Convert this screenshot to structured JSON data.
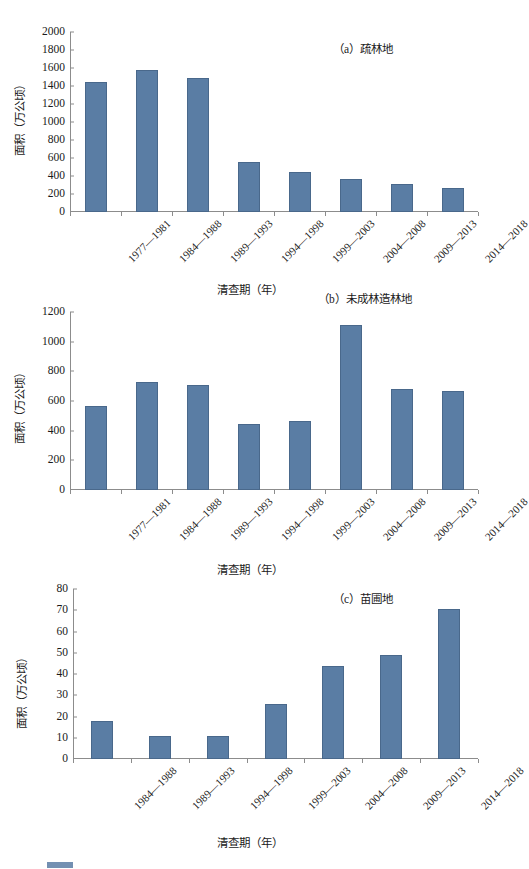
{
  "figure": {
    "axis_titles": {
      "y": "面积（万公顷）",
      "x": "清查期（年）"
    },
    "bar_color": "#5a7da4",
    "axis_color": "#8c8c8c"
  },
  "chart_data": [
    {
      "id": "a",
      "type": "bar",
      "title": "（a）疏林地",
      "xlabel": "清查期（年）",
      "ylabel": "面积（万公顷）",
      "ylim": [
        0,
        2000
      ],
      "yticks": [
        0,
        200,
        400,
        600,
        800,
        1000,
        1200,
        1400,
        1600,
        1800,
        2000
      ],
      "grid": false,
      "legend": "none",
      "categories": [
        "1977—1981",
        "1984—1988",
        "1989—1993",
        "1994—1998",
        "1999—2003",
        "2004—2008",
        "2009—2013",
        "2014—2018"
      ],
      "values": [
        1450,
        1580,
        1485,
        555,
        440,
        365,
        310,
        265
      ]
    },
    {
      "id": "b",
      "type": "bar",
      "title": "（b）未成林造林地",
      "xlabel": "清查期（年）",
      "ylabel": "面积（万公顷）",
      "ylim": [
        0,
        1200
      ],
      "yticks": [
        0,
        200,
        400,
        600,
        800,
        1000,
        1200
      ],
      "grid": false,
      "legend": "none",
      "categories": [
        "1977—1981",
        "1984—1988",
        "1989—1993",
        "1994—1998",
        "1999—2003",
        "2004—2008",
        "2009—2013",
        "2014—2018"
      ],
      "values": [
        565,
        725,
        708,
        448,
        468,
        1110,
        683,
        665
      ]
    },
    {
      "id": "c",
      "type": "bar",
      "title": "（c）苗圃地",
      "xlabel": "清查期（年）",
      "ylabel": "面积（万公顷）",
      "ylim": [
        0,
        80
      ],
      "yticks": [
        0,
        10,
        20,
        30,
        40,
        50,
        60,
        70,
        80
      ],
      "grid": false,
      "legend": "none",
      "categories": [
        "1984—1988",
        "1989—1993",
        "1994—1998",
        "1999—2003",
        "2004—2008",
        "2009—2013",
        "2014—2018"
      ],
      "values": [
        18,
        10.7,
        11,
        26,
        44,
        49,
        70.5
      ]
    }
  ]
}
